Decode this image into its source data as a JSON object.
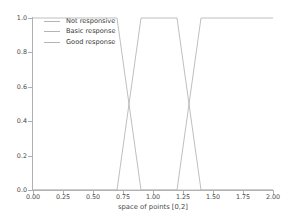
{
  "chart_data": {
    "type": "line",
    "title": "",
    "xlabel": "space of points [0,2]",
    "ylabel": "Membership",
    "xlim": [
      0.0,
      2.0
    ],
    "ylim": [
      0.0,
      1.0
    ],
    "xticks": [
      "0.00",
      "0.25",
      "0.50",
      "0.75",
      "1.00",
      "1.25",
      "1.50",
      "1.75",
      "2.00"
    ],
    "xtick_values": [
      0.0,
      0.25,
      0.5,
      0.75,
      1.0,
      1.25,
      1.5,
      1.75,
      2.0
    ],
    "yticks": [
      "0.0",
      "0.2",
      "0.4",
      "0.6",
      "0.8",
      "1.0"
    ],
    "ytick_values": [
      0.0,
      0.2,
      0.4,
      0.6,
      0.8,
      1.0
    ],
    "grid": false,
    "legend_position": "upper left",
    "legend_frame": false,
    "series": [
      {
        "name": "Not responsive",
        "color": "#b4b4b4",
        "x": [
          0.0,
          0.7,
          0.9,
          2.0
        ],
        "values": [
          1.0,
          1.0,
          0.0,
          0.0
        ]
      },
      {
        "name": "Basic response",
        "color": "#b4b4b4",
        "x": [
          0.0,
          0.7,
          0.9,
          1.2,
          1.4,
          2.0
        ],
        "values": [
          0.0,
          0.0,
          1.0,
          1.0,
          0.0,
          0.0
        ]
      },
      {
        "name": "Good response",
        "color": "#b4b4b4",
        "x": [
          0.0,
          1.2,
          1.4,
          2.0
        ],
        "values": [
          0.0,
          0.0,
          1.0,
          1.0
        ]
      }
    ]
  },
  "legend": {
    "items": [
      {
        "label": "Not responsive"
      },
      {
        "label": "Basic response"
      },
      {
        "label": "Good response"
      }
    ]
  }
}
